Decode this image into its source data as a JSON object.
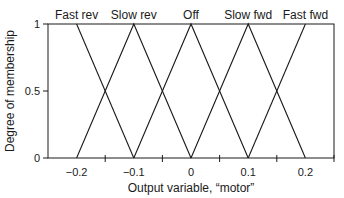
{
  "chart_data": {
    "type": "line",
    "title": "",
    "xlabel": "Output variable, “motor”",
    "ylabel": "Degree of membership",
    "xlim": [
      -0.25,
      0.25
    ],
    "ylim": [
      0,
      1
    ],
    "x_tick_labels": [
      "−0.2",
      "−0.1",
      "0",
      "0.1",
      "0.2"
    ],
    "x_tick_values": [
      -0.2,
      -0.1,
      0,
      0.1,
      0.2
    ],
    "x_tick_marks": [
      -0.15,
      -0.05,
      0.05,
      0.15,
      0.25
    ],
    "y_tick_labels": [
      "0",
      "0.5",
      "1"
    ],
    "y_tick_values": [
      0,
      0.5,
      1
    ],
    "grid": false,
    "legend": "labels above peaks",
    "series": [
      {
        "name": "Fast rev",
        "label_x": -0.2,
        "points": [
          [
            -0.2,
            1
          ],
          [
            -0.1,
            0
          ]
        ]
      },
      {
        "name": "Slow rev",
        "label_x": -0.1,
        "points": [
          [
            -0.2,
            0
          ],
          [
            -0.1,
            1
          ],
          [
            0,
            0
          ]
        ]
      },
      {
        "name": "Off",
        "label_x": 0,
        "points": [
          [
            -0.1,
            0
          ],
          [
            0,
            1
          ],
          [
            0.1,
            0
          ]
        ]
      },
      {
        "name": "Slow fwd",
        "label_x": 0.1,
        "points": [
          [
            0,
            0
          ],
          [
            0.1,
            1
          ],
          [
            0.2,
            0
          ]
        ]
      },
      {
        "name": "Fast fwd",
        "label_x": 0.2,
        "points": [
          [
            0.1,
            0
          ],
          [
            0.2,
            1
          ]
        ]
      }
    ],
    "colors": {
      "line": "#1a1a1a",
      "axis": "#1a1a1a",
      "background": "#ffffff"
    }
  }
}
